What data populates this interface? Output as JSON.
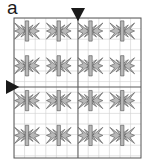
{
  "figure": {
    "panel_label": "a",
    "caption_label_position": "top-left",
    "type": "periodic-tiling-pattern"
  },
  "markers": [
    {
      "name": "top-axis-marker",
      "shape": "triangle-down",
      "x": 78,
      "y": 8,
      "size": 14,
      "color": "#1a1a1a"
    },
    {
      "name": "left-axis-marker",
      "shape": "triangle-right",
      "x": 6,
      "y": 87,
      "size": 14,
      "color": "#1a1a1a"
    }
  ],
  "frame": {
    "x": 14,
    "y": 18,
    "width": 127,
    "height": 140,
    "stroke": "#555555",
    "stroke_width": 1,
    "fill": "#ffffff"
  },
  "grid": {
    "minor_stroke": "#cfcfcf",
    "minor_stroke_width": 0.6,
    "major_stroke": "#5a5a5a",
    "major_stroke_width": 1.0,
    "cell_size": 10.6,
    "major_x": [
      78
    ],
    "major_y": [
      87
    ]
  },
  "motif": {
    "name": "butterfly-star",
    "fill": "#b8b8b8",
    "stroke": "#4a4a4a",
    "stroke_width": 0.55,
    "period_x": 31.75,
    "period_y": 34.8,
    "offset_x": 27,
    "offset_y": 31,
    "radius": 13
  },
  "colors": {
    "ink": "#1a1a1a",
    "frame": "#555555",
    "grid_minor": "#cfcfcf",
    "grid_major": "#5a5a5a",
    "motif_fill": "#b8b8b8",
    "motif_stroke": "#4a4a4a",
    "background": "#ffffff"
  }
}
